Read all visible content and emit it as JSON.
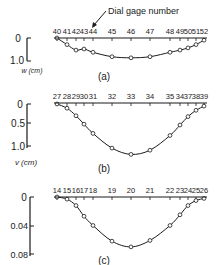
{
  "annotation": "Dial gage number",
  "chart_data": [
    {
      "type": "line",
      "panel": "(a)",
      "title": "",
      "xlabel": "Dial gage number",
      "ylabel": "w (cm)",
      "yticks": [
        "0",
        "1.0"
      ],
      "ylim": [
        0,
        1.0
      ],
      "inverted_y": true,
      "x_tick_labels": [
        "40",
        "41",
        "42",
        "43",
        "44",
        "45",
        "46",
        "47",
        "48",
        "49",
        "50",
        "51",
        "52"
      ],
      "points": [
        {
          "gage": "40",
          "value": 0.0
        },
        {
          "gage": "41",
          "value": 0.3
        },
        {
          "gage": "42",
          "value": 0.55
        },
        {
          "gage": "43",
          "value": 0.5
        },
        {
          "gage": "44",
          "value": 0.65
        },
        {
          "gage": "45",
          "value": 0.85
        },
        {
          "gage": "46",
          "value": 0.9
        },
        {
          "gage": "47",
          "value": 0.85
        },
        {
          "gage": "48",
          "value": 0.65
        },
        {
          "gage": "49",
          "value": 0.55
        },
        {
          "gage": "50",
          "value": 0.45
        },
        {
          "gage": "51",
          "value": 0.3
        },
        {
          "gage": "52",
          "value": 0.1
        }
      ]
    },
    {
      "type": "line",
      "panel": "(b)",
      "title": "",
      "xlabel": "",
      "ylabel": "v (cm)",
      "yticks": [
        "0",
        "0.5",
        "1.0"
      ],
      "ylim": [
        0,
        1.2
      ],
      "inverted_y": true,
      "x_tick_labels": [
        "27",
        "28",
        "29",
        "30",
        "31",
        "32",
        "33",
        "34",
        "35",
        "34",
        "37",
        "38",
        "39"
      ],
      "points": [
        {
          "gage": "27",
          "value": 0.0
        },
        {
          "gage": "28",
          "value": 0.1
        },
        {
          "gage": "29",
          "value": 0.28
        },
        {
          "gage": "30",
          "value": 0.48
        },
        {
          "gage": "31",
          "value": 0.7
        },
        {
          "gage": "32",
          "value": 1.05
        },
        {
          "gage": "33",
          "value": 1.2
        },
        {
          "gage": "34",
          "value": 1.1
        },
        {
          "gage": "35",
          "value": 0.75
        },
        {
          "gage": "36",
          "value": 0.5
        },
        {
          "gage": "37",
          "value": 0.3
        },
        {
          "gage": "38",
          "value": 0.15
        },
        {
          "gage": "39",
          "value": 0.05
        }
      ]
    },
    {
      "type": "line",
      "panel": "(c)",
      "title": "",
      "xlabel": "",
      "ylabel": "",
      "yticks": [
        "0",
        "0.04",
        "0.08"
      ],
      "ylim": [
        0,
        0.08
      ],
      "inverted_y": true,
      "x_tick_labels": [
        "14",
        "15",
        "16",
        "17",
        "18",
        "19",
        "20",
        "21",
        "22",
        "23",
        "24",
        "25",
        "26"
      ],
      "points": [
        {
          "gage": "14",
          "value": 0.0
        },
        {
          "gage": "15",
          "value": 0.003
        },
        {
          "gage": "16",
          "value": 0.012
        },
        {
          "gage": "17",
          "value": 0.027
        },
        {
          "gage": "18",
          "value": 0.04
        },
        {
          "gage": "19",
          "value": 0.062
        },
        {
          "gage": "20",
          "value": 0.07
        },
        {
          "gage": "21",
          "value": 0.061
        },
        {
          "gage": "22",
          "value": 0.04
        },
        {
          "gage": "23",
          "value": 0.025
        },
        {
          "gage": "24",
          "value": 0.012
        },
        {
          "gage": "25",
          "value": 0.005
        },
        {
          "gage": "26",
          "value": 0.002
        }
      ]
    }
  ],
  "panels": {
    "a": {
      "label": "(a)",
      "ylabel": "w (cm)",
      "ytick_0": "0",
      "ytick_1": "1.0"
    },
    "b": {
      "label": "(b)",
      "ylabel": "v (cm)",
      "ytick_0": "0",
      "ytick_1": "0.5",
      "ytick_2": "1.0"
    },
    "c": {
      "label": "(c)",
      "ytick_0": "0",
      "ytick_1": "0.04",
      "ytick_2": "0.08"
    }
  }
}
